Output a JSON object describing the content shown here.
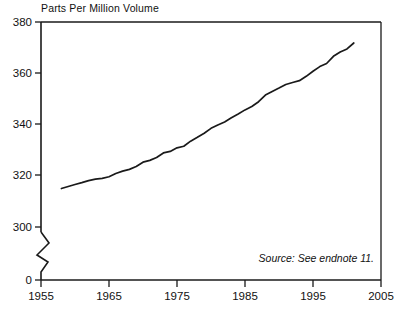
{
  "chart_data": {
    "type": "line",
    "title": "Parts Per Million Volume",
    "xlabel": "",
    "ylabel": "",
    "xlim": [
      1955,
      2005
    ],
    "ylim": [
      300,
      380
    ],
    "y_axis_break": true,
    "y_break_labels": [
      "0",
      "300"
    ],
    "grid": false,
    "legend": null,
    "annotation": "Source: See endnote 11.",
    "xticks": [
      1955,
      1965,
      1975,
      1985,
      1995,
      2005
    ],
    "xtick_labels": [
      "1955",
      "1965",
      "1975",
      "1985",
      "1995",
      "2005"
    ],
    "yticks": [
      300,
      320,
      340,
      360,
      380
    ],
    "ytick_labels": [
      "300",
      "320",
      "340",
      "360",
      "380"
    ],
    "ytick_zero_label": "0",
    "series": [
      {
        "name": "Atmospheric concentration",
        "x": [
          1958,
          1959,
          1960,
          1961,
          1962,
          1963,
          1964,
          1965,
          1966,
          1967,
          1968,
          1969,
          1970,
          1971,
          1972,
          1973,
          1974,
          1975,
          1976,
          1977,
          1978,
          1979,
          1980,
          1981,
          1982,
          1983,
          1984,
          1985,
          1986,
          1987,
          1988,
          1989,
          1990,
          1991,
          1992,
          1993,
          1994,
          1995,
          1996,
          1997,
          1998,
          1999,
          2000,
          2001
        ],
        "values": [
          315.0,
          315.8,
          316.6,
          317.3,
          318.1,
          318.7,
          319.0,
          319.6,
          320.9,
          321.8,
          322.5,
          323.6,
          325.3,
          326.0,
          327.1,
          328.9,
          329.5,
          330.9,
          331.5,
          333.5,
          335.0,
          336.6,
          338.5,
          339.8,
          341.0,
          342.6,
          344.1,
          345.7,
          347.0,
          348.9,
          351.5,
          352.9,
          354.2,
          355.6,
          356.4,
          357.1,
          358.8,
          360.8,
          362.6,
          363.8,
          366.6,
          368.3,
          369.5,
          371.8
        ]
      }
    ]
  },
  "axis_break_marker": "zigzag"
}
